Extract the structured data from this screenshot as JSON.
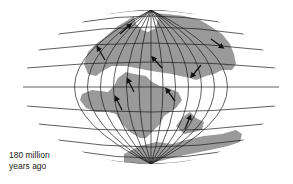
{
  "figure": {
    "type": "paleogeographic-map",
    "projection": "elliptical-equal-area-graticule",
    "caption": {
      "line1": "180 million",
      "line2": "years ago"
    },
    "colors": {
      "land": "#9a9a9a",
      "ocean": "#ffffff",
      "graticule": "#1a1a1a",
      "arrow": "#111111"
    },
    "landmasses": [
      {
        "name": "laurasia"
      },
      {
        "name": "south-america-africa"
      },
      {
        "name": "india-madagascar"
      },
      {
        "name": "antarctica-australia"
      }
    ],
    "arrows_count": 9
  }
}
